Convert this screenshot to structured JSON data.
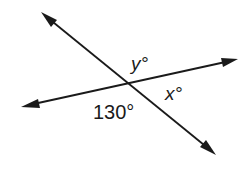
{
  "figure": {
    "lines": [
      {
        "name": "line-a",
        "direction": "upper-left to lower-right",
        "arrows": "both ends"
      },
      {
        "name": "line-b",
        "direction": "left to right, rising",
        "arrows": "both ends"
      }
    ],
    "angle_labels": {
      "y": {
        "variable": "y",
        "unit": "°",
        "text": "y°",
        "position": "top"
      },
      "x": {
        "variable": "x",
        "unit": "°",
        "text": "x°",
        "position": "right"
      },
      "given": {
        "value": 130,
        "unit": "°",
        "text": "130°",
        "position": "bottom"
      }
    },
    "colors": {
      "stroke": "#1a1a1a",
      "background": "#ffffff"
    }
  }
}
